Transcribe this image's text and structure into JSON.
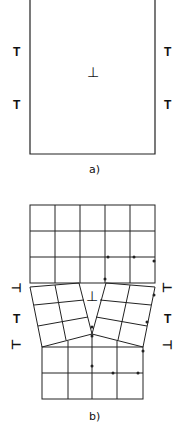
{
  "figure": {
    "panel_a": {
      "caption": "a)",
      "center_symbol": "⊥",
      "side_symbols": [
        "T",
        "T",
        "T",
        "T"
      ]
    },
    "panel_b": {
      "caption": "b)",
      "center_symbol": "⊥",
      "left_symbols": [
        "⊣",
        "T",
        "⊢"
      ],
      "right_symbols": [
        "⊢",
        "T",
        "⊣"
      ]
    }
  },
  "colors": {
    "line": "#222222",
    "background": "#ffffff"
  }
}
